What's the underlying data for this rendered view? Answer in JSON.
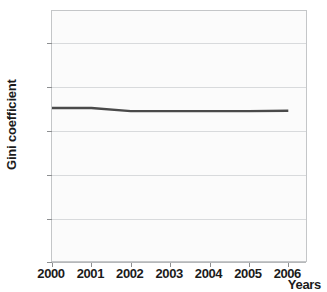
{
  "chart_data": {
    "type": "line",
    "title": "",
    "xlabel": "Years",
    "ylabel": "Gini coefficient",
    "x": [
      2000,
      2001,
      2002,
      2003,
      2004,
      2005,
      2006
    ],
    "xticklabels": [
      "2000",
      "2001",
      "2002",
      "2003",
      "2004",
      "2005",
      "2006"
    ],
    "yticklabels": [
      "0",
      "0.1",
      "0.2",
      "0.3",
      "0.4",
      "0.5"
    ],
    "ytickvalues": [
      0,
      0.1,
      0.2,
      0.3,
      0.4,
      0.5
    ],
    "xlim": [
      2000,
      2006.5
    ],
    "ylim": [
      0,
      0.5725
    ],
    "grid": true,
    "legend": false,
    "series": [
      {
        "name": "Gini coefficient",
        "color": "#4a4a4a",
        "values": [
          0.352,
          0.352,
          0.345,
          0.345,
          0.345,
          0.345,
          0.346
        ]
      }
    ]
  },
  "style": {
    "line_color": "#4a4a4a",
    "grid_color": "#d8dadc",
    "frame_color": "#c4c6c8",
    "plot_background": "#fbfbfb",
    "page_background": "#ffffff",
    "text_color": "#1b1b1b"
  }
}
